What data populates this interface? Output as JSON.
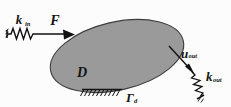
{
  "figure": {
    "background_color": "#fcfcfc",
    "domain": {
      "label": "D",
      "sublabel": "",
      "fill_color": "#9a9a9a",
      "stroke_color": "#3d3d3d"
    },
    "input": {
      "spring_label_base": "k",
      "spring_label_sub": "in",
      "force_label": "F",
      "anchor_icon": "ground-anchor-icon",
      "spring_icon": "coil-spring-icon",
      "arrow_icon": "arrow-right-icon"
    },
    "output": {
      "displacement_label_base": "u",
      "displacement_label_sub": "out",
      "spring_label_base": "k",
      "spring_label_sub": "out",
      "anchor_icon": "ground-anchor-icon",
      "spring_icon": "coil-spring-icon",
      "arrow_icon": "arrow-down-right-icon"
    },
    "boundary": {
      "label_base": "Γ",
      "label_sub": "d",
      "support_icon": "fixed-support-hatch-icon"
    }
  }
}
